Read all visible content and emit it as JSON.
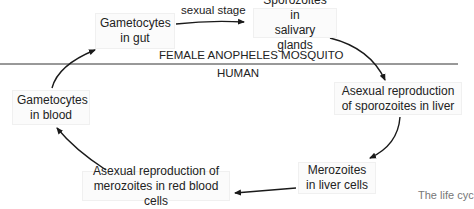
{
  "diagram": {
    "nodes": {
      "gametocytes_gut": {
        "line1": "Gametocytes",
        "line2": "in gut"
      },
      "sporozoites_glands": {
        "line1": "Sporozoites in",
        "line2": "salivary glands"
      },
      "asexual_liver": {
        "line1": "Asexual reproduction",
        "line2": "of sporozoites in liver"
      },
      "merozoites_liver": {
        "line1": "Merozoites",
        "line2": "in liver cells"
      },
      "asexual_rbc": {
        "line1": "Asexual reproduction of",
        "line2": "merozoites in red blood cells"
      },
      "gametocytes_blood": {
        "line1": "Gametocytes",
        "line2": "in blood"
      }
    },
    "edge_labels": {
      "sexual_stage": "sexual stage"
    },
    "regions": {
      "mosquito": "FEMALE ANOPHELES MOSQUITO",
      "human": "HUMAN"
    },
    "caption": "The life cyc",
    "colors": {
      "line": "#1a1a1a",
      "box_bg": "#fbfbfb",
      "caption": "#777777"
    }
  }
}
